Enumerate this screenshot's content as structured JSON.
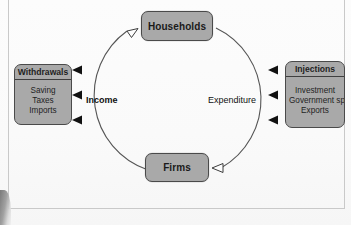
{
  "diagram": {
    "nodes": {
      "households": {
        "label": "Households"
      },
      "firms": {
        "label": "Firms"
      }
    },
    "withdrawals": {
      "header": "Withdrawals",
      "items": [
        "Saving",
        "Taxes",
        "Imports"
      ]
    },
    "injections": {
      "header": "Injections",
      "items": [
        "Investment",
        "Government spending",
        "Exports"
      ]
    },
    "flows": {
      "income": "Income",
      "expenditure": "Expenditure"
    },
    "colors": {
      "box_fill": "#a9a9a9",
      "box_border": "#4a4a4a",
      "circle_stroke": "#555555",
      "arrow_solid": "#111111",
      "arrow_hollow_fill": "#fdfdfd",
      "page_background": "#fdfdfd",
      "frame_line": "#c9c9c9"
    },
    "geometry": {
      "circle_center_x": 176,
      "circle_center_y": 100,
      "circle_radius": 79
    }
  }
}
